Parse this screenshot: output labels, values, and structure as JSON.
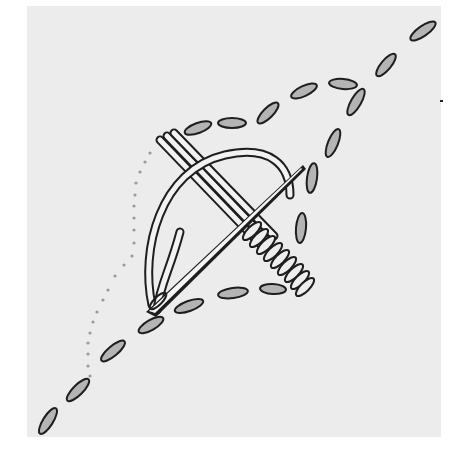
{
  "figure": {
    "colors": {
      "background": "#ffffff",
      "fabric": "#ececec",
      "stitch_fill": "#b4b4b4",
      "outline": "#1e1e1e",
      "dotted_path": "#9a9a9a",
      "thread_fill": "#f2f2f2"
    },
    "fabric_rect": {
      "x": 27,
      "y": 6,
      "width": 414,
      "height": 431
    },
    "stitches": [
      {
        "cx": 48,
        "cy": 421,
        "rx": 15,
        "ry": 5,
        "angle": -58
      },
      {
        "cx": 78,
        "cy": 390,
        "rx": 15,
        "ry": 5,
        "angle": -45
      },
      {
        "cx": 113,
        "cy": 351,
        "rx": 15,
        "ry": 5,
        "angle": -40
      },
      {
        "cx": 151,
        "cy": 325,
        "rx": 14,
        "ry": 5,
        "angle": -30
      },
      {
        "cx": 189,
        "cy": 306,
        "rx": 15,
        "ry": 5,
        "angle": -20
      },
      {
        "cx": 233,
        "cy": 293,
        "rx": 15,
        "ry": 5,
        "angle": -8
      },
      {
        "cx": 273,
        "cy": 289,
        "rx": 13,
        "ry": 5,
        "angle": 3
      },
      {
        "cx": 198,
        "cy": 128,
        "rx": 14,
        "ry": 5,
        "angle": -20
      },
      {
        "cx": 232,
        "cy": 123,
        "rx": 14,
        "ry": 5,
        "angle": 0
      },
      {
        "cx": 268,
        "cy": 113,
        "rx": 14,
        "ry": 5,
        "angle": -45
      },
      {
        "cx": 304,
        "cy": 91,
        "rx": 14,
        "ry": 5,
        "angle": -25
      },
      {
        "cx": 343,
        "cy": 84,
        "rx": 14,
        "ry": 5,
        "angle": 5
      },
      {
        "cx": 356,
        "cy": 102,
        "rx": 15,
        "ry": 5,
        "angle": -60
      },
      {
        "cx": 386,
        "cy": 65,
        "rx": 14,
        "ry": 5,
        "angle": -50
      },
      {
        "cx": 423,
        "cy": 31,
        "rx": 15,
        "ry": 5,
        "angle": -35
      },
      {
        "cx": 333,
        "cy": 143,
        "rx": 15,
        "ry": 5,
        "angle": -68
      },
      {
        "cx": 312,
        "cy": 178,
        "rx": 15,
        "ry": 5,
        "angle": -82
      },
      {
        "cx": 301,
        "cy": 228,
        "rx": 15,
        "ry": 5,
        "angle": -85
      }
    ],
    "dotted_path": [
      [
        150,
        153
      ],
      [
        145,
        162
      ],
      [
        140,
        172
      ],
      [
        136,
        183
      ],
      [
        135,
        195
      ],
      [
        134,
        206
      ],
      [
        134,
        218
      ],
      [
        134,
        230
      ],
      [
        134,
        243
      ],
      [
        132,
        256
      ],
      [
        124,
        265
      ],
      [
        115,
        276
      ],
      [
        108,
        290
      ],
      [
        103,
        300
      ],
      [
        97,
        312
      ],
      [
        93,
        322
      ],
      [
        90,
        333
      ],
      [
        88,
        343
      ],
      [
        88,
        354
      ],
      [
        88,
        366
      ],
      [
        90,
        376
      ]
    ],
    "wraps": [
      {
        "cx": 252,
        "cy": 231,
        "angle": 45
      },
      {
        "cx": 259,
        "cy": 238,
        "angle": 45
      },
      {
        "cx": 266,
        "cy": 245,
        "angle": 45
      },
      {
        "cx": 273,
        "cy": 252,
        "angle": 45
      },
      {
        "cx": 280,
        "cy": 259,
        "angle": 45
      },
      {
        "cx": 287,
        "cy": 266,
        "angle": 45
      },
      {
        "cx": 294,
        "cy": 273,
        "angle": 45
      },
      {
        "cx": 300,
        "cy": 280,
        "angle": 45
      },
      {
        "cx": 305,
        "cy": 287,
        "angle": 45
      }
    ],
    "speck": {
      "x": 440,
      "y": 100
    }
  }
}
